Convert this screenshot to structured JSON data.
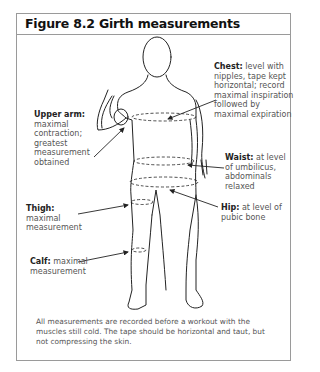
{
  "figure": {
    "title": "Figure 8.2 Girth measurements"
  },
  "labels": {
    "chest": {
      "name": "Chest:",
      "lines": [
        " level with",
        "nipples, tape kept",
        "horizontal; record",
        "maximal inspiration",
        "followed by",
        "maximal expiration"
      ]
    },
    "upper_arm": {
      "name": "Upper arm:",
      "lines": [
        "maximal",
        "contraction;",
        "greatest",
        "measurement",
        "obtained"
      ]
    },
    "waist": {
      "name": "Waist:",
      "lines": [
        " at level",
        "of umbilicus,",
        "abdominals",
        "relaxed"
      ]
    },
    "hip": {
      "name": "Hip:",
      "lines": [
        " at level of",
        "pubic bone"
      ]
    },
    "thigh": {
      "name": "Thigh:",
      "lines": [
        " maximal",
        "measurement"
      ]
    },
    "calf": {
      "name": "Calf:",
      "lines": [
        " maximal",
        "measurement"
      ]
    }
  },
  "caption": "All measurements are recorded before a workout with the muscles still cold. The tape should be horizontal and taut, but not compressing the skin.",
  "colors": {
    "border": "#9a9a9a",
    "line": "#222222",
    "text": "#555555"
  }
}
